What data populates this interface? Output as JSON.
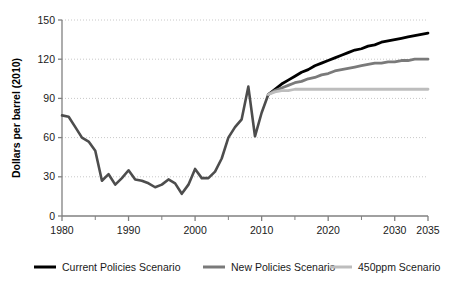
{
  "chart_data": {
    "type": "line",
    "title": "",
    "xlabel": "",
    "ylabel": "Dollars per barrel (2010)",
    "xlim": [
      1980,
      2035
    ],
    "ylim": [
      0,
      150
    ],
    "grid": true,
    "grid_axis": "y",
    "legend_position": "bottom",
    "x_tick_labels": [
      "1980",
      "1990",
      "2000",
      "2010",
      "2020",
      "2030",
      "2035"
    ],
    "x_tick_values": [
      1980,
      1990,
      2000,
      2010,
      2020,
      2030,
      2035
    ],
    "x_minor_ticks": [
      1985,
      1995,
      2005,
      2015,
      2025
    ],
    "y_tick_labels": [
      "0",
      "30",
      "60",
      "90",
      "120",
      "150"
    ],
    "y_tick_values": [
      0,
      30,
      60,
      90,
      120,
      150
    ],
    "series": [
      {
        "name": "Historical",
        "color": "#4d4d4d",
        "width": 2.6,
        "show_in_legend": false,
        "x": [
          1980,
          1981,
          1982,
          1983,
          1984,
          1985,
          1986,
          1987,
          1988,
          1989,
          1990,
          1991,
          1992,
          1993,
          1994,
          1995,
          1996,
          1997,
          1998,
          1999,
          2000,
          2001,
          2002,
          2003,
          2004,
          2005,
          2006,
          2007,
          2008,
          2009,
          2010,
          2011
        ],
        "values": [
          77,
          76,
          68,
          60,
          57,
          50,
          27,
          32,
          24,
          29,
          35,
          28,
          27,
          25,
          22,
          24,
          28,
          25,
          17,
          24,
          36,
          29,
          29,
          34,
          44,
          60,
          68,
          74,
          99,
          61,
          79,
          93
        ]
      },
      {
        "name": "Current Policies Scenario",
        "color": "#000000",
        "width": 2.8,
        "show_in_legend": true,
        "x": [
          2011,
          2012,
          2013,
          2014,
          2015,
          2016,
          2017,
          2018,
          2019,
          2020,
          2021,
          2022,
          2023,
          2024,
          2025,
          2026,
          2027,
          2028,
          2029,
          2030,
          2031,
          2032,
          2033,
          2034,
          2035
        ],
        "values": [
          93,
          97,
          101,
          104,
          107,
          110,
          112,
          115,
          117,
          119,
          121,
          123,
          125,
          127,
          128,
          130,
          131,
          133,
          134,
          135,
          136,
          137,
          138,
          139,
          140
        ]
      },
      {
        "name": "New Policies Scenario",
        "color": "#7a7a7a",
        "width": 2.8,
        "show_in_legend": true,
        "x": [
          2011,
          2012,
          2013,
          2014,
          2015,
          2016,
          2017,
          2018,
          2019,
          2020,
          2021,
          2022,
          2023,
          2024,
          2025,
          2026,
          2027,
          2028,
          2029,
          2030,
          2031,
          2032,
          2033,
          2034,
          2035
        ],
        "values": [
          93,
          96,
          98,
          100,
          102,
          103,
          105,
          106,
          108,
          109,
          111,
          112,
          113,
          114,
          115,
          116,
          117,
          117,
          118,
          118,
          119,
          119,
          120,
          120,
          120
        ]
      },
      {
        "name": "450ppm Scenario",
        "color": "#bdbdbd",
        "width": 2.8,
        "show_in_legend": true,
        "x": [
          2011,
          2012,
          2013,
          2014,
          2015,
          2016,
          2017,
          2018,
          2019,
          2020,
          2021,
          2022,
          2023,
          2024,
          2025,
          2026,
          2027,
          2028,
          2029,
          2030,
          2031,
          2032,
          2033,
          2034,
          2035
        ],
        "values": [
          93,
          95,
          96,
          96,
          97,
          97,
          97,
          97,
          97,
          97,
          97,
          97,
          97,
          97,
          97,
          97,
          97,
          97,
          97,
          97,
          97,
          97,
          97,
          97,
          97
        ]
      }
    ]
  },
  "legend": {
    "items": [
      {
        "label": "Current Policies Scenario",
        "color": "#000000"
      },
      {
        "label": "New Policies Scenario",
        "color": "#7a7a7a"
      },
      {
        "label": "450ppm Scenario",
        "color": "#bdbdbd"
      }
    ]
  },
  "axes": {
    "y_title": "Dollars per barrel (2010)"
  },
  "colors": {
    "axis": "#808080",
    "grid": "#c8c8c8",
    "text": "#1a1a1a"
  }
}
